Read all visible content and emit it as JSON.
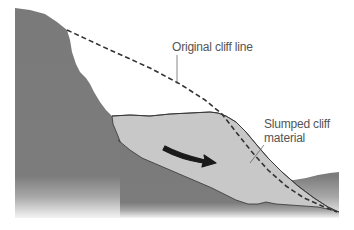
{
  "diagram": {
    "labels": {
      "original_cliff_line": "Original cliff line",
      "slumped_line1": "Slumped cliff",
      "slumped_line2": "material"
    },
    "colors": {
      "bedrock": "#7a7a7a",
      "slumped_material": "#c8c8c8",
      "dashed_line": "#333333",
      "arrow": "#1a1a1a",
      "label_text": "#555555",
      "background": "#ffffff"
    },
    "elements": [
      {
        "name": "bedrock",
        "description": "Dark gray cliff and ground mass"
      },
      {
        "name": "slumped-material",
        "description": "Light gray slumped deposit at foot of cliff"
      },
      {
        "name": "original-cliff-line",
        "description": "Dashed line showing former cliff profile"
      },
      {
        "name": "movement-arrow",
        "description": "Black arrow showing downslope movement"
      }
    ]
  }
}
